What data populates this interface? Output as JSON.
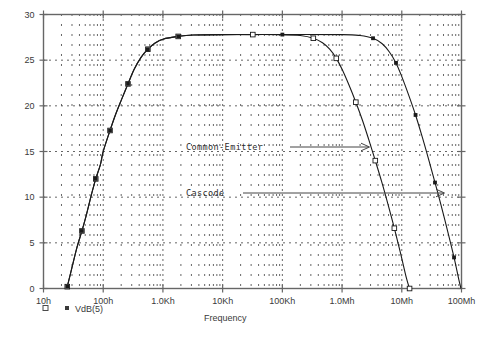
{
  "chart_data": {
    "type": "line",
    "title": "",
    "xlabel": "Frequency",
    "ylabel": "",
    "xscale": "log",
    "xlim": [
      10,
      100000000
    ],
    "ylim": [
      0,
      30
    ],
    "yticks": [
      0,
      5,
      10,
      15,
      20,
      25,
      30
    ],
    "xticks": [
      10,
      100,
      1000,
      10000,
      100000,
      1000000,
      10000000,
      100000000
    ],
    "xtick_labels": [
      "10h",
      "100h",
      "1.0Kh",
      "10Kh",
      "100Kh",
      "1.0Mh",
      "10Mh",
      "100Mh"
    ],
    "ytick_labels": [
      "0",
      "5",
      "10",
      "15",
      "20",
      "25",
      "30"
    ],
    "grid": true,
    "grid_style": "dotted",
    "legend": [
      "VdB(5)"
    ],
    "legend_position": "below-axis-left",
    "series": [
      {
        "name": "Common-Emitter",
        "marker": "open-square",
        "points": [
          [
            25,
            0.2
          ],
          [
            30,
            2.3
          ],
          [
            36,
            4.4
          ],
          [
            44,
            6.3
          ],
          [
            52,
            8.0
          ],
          [
            63,
            10.2
          ],
          [
            75,
            12.0
          ],
          [
            90,
            13.6
          ],
          [
            100,
            15.0
          ],
          [
            130,
            17.3
          ],
          [
            160,
            19.0
          ],
          [
            200,
            20.6
          ],
          [
            260,
            22.4
          ],
          [
            330,
            24.0
          ],
          [
            430,
            25.3
          ],
          [
            560,
            26.2
          ],
          [
            750,
            26.9
          ],
          [
            1000,
            27.3
          ],
          [
            1800,
            27.6
          ],
          [
            3200,
            27.75
          ],
          [
            10000,
            27.8
          ],
          [
            32000,
            27.8
          ],
          [
            100000,
            27.8
          ],
          [
            200000,
            27.7
          ],
          [
            330000,
            27.4
          ],
          [
            470000,
            26.9
          ],
          [
            620000,
            26.2
          ],
          [
            800000,
            25.2
          ],
          [
            1000000,
            24.0
          ],
          [
            1300000,
            22.3
          ],
          [
            1700000,
            20.4
          ],
          [
            2200000,
            18.4
          ],
          [
            2800000,
            16.3
          ],
          [
            3600000,
            14.0
          ],
          [
            4600000,
            11.7
          ],
          [
            6000000,
            9.0
          ],
          [
            7500000,
            6.6
          ],
          [
            9500000,
            3.9
          ],
          [
            12000000,
            1.1
          ],
          [
            13500000,
            0.0
          ]
        ]
      },
      {
        "name": "Cascode",
        "marker": "filled-square",
        "points": [
          [
            25,
            0.2
          ],
          [
            30,
            2.3
          ],
          [
            36,
            4.4
          ],
          [
            44,
            6.3
          ],
          [
            52,
            8.0
          ],
          [
            63,
            10.2
          ],
          [
            75,
            12.0
          ],
          [
            90,
            13.6
          ],
          [
            100,
            15.0
          ],
          [
            130,
            17.3
          ],
          [
            160,
            19.0
          ],
          [
            200,
            20.6
          ],
          [
            260,
            22.4
          ],
          [
            330,
            24.0
          ],
          [
            430,
            25.3
          ],
          [
            560,
            26.2
          ],
          [
            750,
            26.9
          ],
          [
            1000,
            27.3
          ],
          [
            1800,
            27.6
          ],
          [
            3200,
            27.75
          ],
          [
            10000,
            27.8
          ],
          [
            100000,
            27.8
          ],
          [
            1000000,
            27.8
          ],
          [
            2000000,
            27.7
          ],
          [
            3300000,
            27.4
          ],
          [
            4700000,
            26.8
          ],
          [
            6200000,
            25.9
          ],
          [
            8000000,
            24.7
          ],
          [
            10000000,
            23.2
          ],
          [
            13000000,
            21.2
          ],
          [
            17000000,
            19.0
          ],
          [
            22000000,
            16.6
          ],
          [
            28000000,
            14.2
          ],
          [
            36000000,
            11.6
          ],
          [
            46000000,
            9.0
          ],
          [
            60000000,
            6.0
          ],
          [
            75000000,
            3.4
          ],
          [
            90000000,
            1.0
          ],
          [
            98000000,
            0.0
          ]
        ]
      }
    ],
    "annotations": [
      {
        "text": "Common-Emitter",
        "arrow": "right",
        "target_series": "Common-Emitter"
      },
      {
        "text": "Cascode",
        "arrow": "right",
        "target_series": "Cascode"
      }
    ]
  },
  "legend": {
    "entries": [
      {
        "marker": "open-square",
        "label": ""
      },
      {
        "marker": "filled-square",
        "label": "VdB(5)"
      }
    ],
    "text": "VdB(5)"
  },
  "axis": {
    "x_title": "Frequency"
  },
  "colors": {
    "curve": "#1a1a1a",
    "frame": "#666666",
    "grid": "#555555",
    "text": "#3a3a3a"
  }
}
